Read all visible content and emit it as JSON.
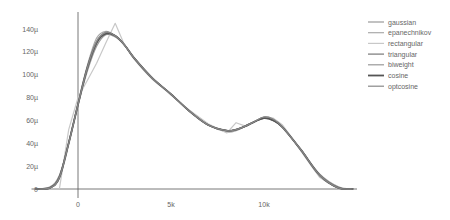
{
  "chart_data": {
    "type": "line",
    "title": "",
    "xlabel": "",
    "ylabel": "",
    "xlim": [
      -2500,
      15000
    ],
    "ylim": [
      0,
      150
    ],
    "grid": false,
    "legend_position": "top-right",
    "x_ticks": [
      {
        "value": 0,
        "label": "0"
      },
      {
        "value": 5000,
        "label": "5k"
      },
      {
        "value": 10000,
        "label": "10k"
      }
    ],
    "y_ticks": [
      {
        "value": 0,
        "label": "0"
      },
      {
        "value": 20,
        "label": "20µ"
      },
      {
        "value": 40,
        "label": "40µ"
      },
      {
        "value": 60,
        "label": "60µ"
      },
      {
        "value": 80,
        "label": "80µ"
      },
      {
        "value": 100,
        "label": "100µ"
      },
      {
        "value": 120,
        "label": "120µ"
      },
      {
        "value": 140,
        "label": "140µ"
      }
    ],
    "x": [
      -2300,
      -1500,
      -1000,
      -500,
      0,
      500,
      1000,
      1500,
      2000,
      2500,
      3000,
      4000,
      5000,
      6000,
      7000,
      8000,
      8500,
      9000,
      9500,
      10000,
      10500,
      11000,
      12000,
      13000,
      14000,
      14800
    ],
    "series": [
      {
        "name": "gaussian",
        "color": "#999999",
        "width": 1.2,
        "values": [
          0,
          2,
          12,
          40,
          73,
          103,
          125,
          135,
          133,
          126,
          115,
          97,
          83,
          68,
          56,
          51,
          52,
          55,
          59,
          62,
          60,
          54,
          34,
          13,
          2,
          0
        ]
      },
      {
        "name": "epanechnikov",
        "color": "#aaaaaa",
        "width": 1.2,
        "values": [
          0,
          1,
          10,
          40,
          75,
          108,
          132,
          138,
          134,
          126,
          114,
          96,
          83,
          68,
          56,
          50,
          51,
          55,
          59,
          63,
          61,
          55,
          33,
          11,
          1,
          0
        ]
      },
      {
        "name": "rectangular",
        "color": "#c8c8c8",
        "width": 1.2,
        "values": [
          0,
          0,
          0,
          52,
          80,
          95,
          110,
          128,
          145,
          126,
          115,
          97,
          82,
          69,
          57,
          49,
          58,
          55,
          59,
          63,
          62,
          56,
          34,
          10,
          0,
          0
        ]
      },
      {
        "name": "triangular",
        "color": "#777777",
        "width": 1.2,
        "values": [
          0,
          1,
          11,
          41,
          74,
          105,
          128,
          137,
          134,
          126,
          115,
          97,
          83,
          68,
          56,
          51,
          52,
          55,
          59,
          62,
          60,
          54,
          34,
          12,
          1,
          0
        ]
      },
      {
        "name": "biweight",
        "color": "#999999",
        "width": 1.2,
        "values": [
          0,
          1,
          10,
          40,
          74,
          106,
          129,
          137,
          134,
          126,
          115,
          97,
          83,
          68,
          56,
          51,
          52,
          55,
          59,
          63,
          61,
          54,
          34,
          12,
          1,
          0
        ]
      },
      {
        "name": "cosine",
        "color": "#555555",
        "width": 1.8,
        "values": [
          0,
          1,
          10,
          40,
          74,
          106,
          128,
          136,
          134,
          126,
          115,
          97,
          83,
          68,
          56,
          51,
          52,
          55,
          59,
          62,
          60,
          54,
          34,
          12,
          1,
          0
        ]
      },
      {
        "name": "optcosine",
        "color": "#888888",
        "width": 1.2,
        "values": [
          0,
          1,
          10,
          40,
          74,
          106,
          129,
          137,
          134,
          126,
          115,
          97,
          83,
          68,
          56,
          51,
          52,
          55,
          59,
          63,
          61,
          54,
          34,
          12,
          1,
          0
        ]
      }
    ]
  },
  "legend": {
    "items": [
      "gaussian",
      "epanechnikov",
      "rectangular",
      "triangular",
      "biweight",
      "cosine",
      "optcosine"
    ]
  }
}
